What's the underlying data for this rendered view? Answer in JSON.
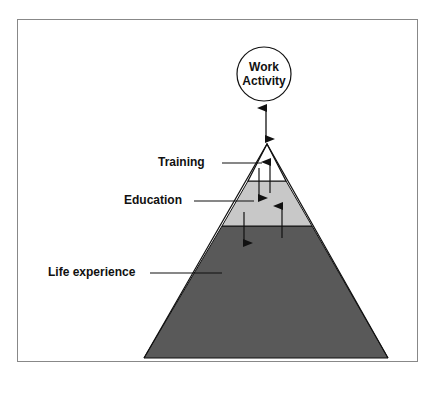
{
  "diagram": {
    "top_node": {
      "line1": "Work",
      "line2": "Activity"
    },
    "layers": [
      {
        "label": "Training",
        "color": "#ffffff"
      },
      {
        "label": "Education",
        "color": "#c8c8c8"
      },
      {
        "label": "Life experience",
        "color": "#595959"
      }
    ],
    "colors": {
      "outline": "#111111",
      "frame": "#888888"
    }
  }
}
